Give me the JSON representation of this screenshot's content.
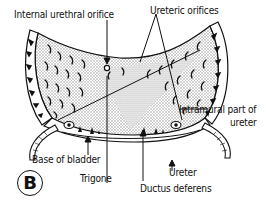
{
  "figure": {
    "panel_letter": "B",
    "labels": {
      "internal_urethral_orifice": "Internal urethral orifice",
      "ureteric_orifices": "Ureteric orifices",
      "intramural_part_line1": "Intramural part of",
      "intramural_part_line2": "ureter",
      "base_of_bladder": "Base of bladder",
      "trigone": "Trigone",
      "ductus_deferens": "Ductus deferens",
      "ureter": "Ureter"
    },
    "colors": {
      "ink": "#111111",
      "stipple": "#b8b8b8",
      "background": "#ffffff"
    }
  }
}
